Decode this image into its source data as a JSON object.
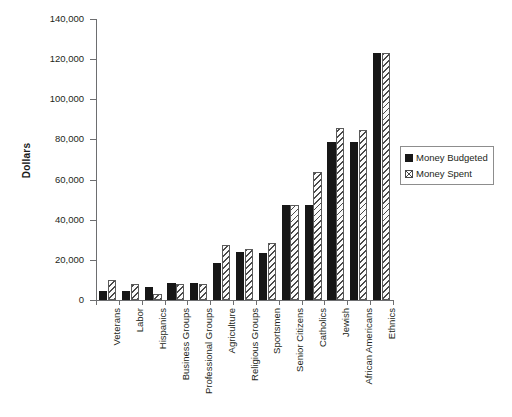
{
  "chart_data": {
    "type": "bar",
    "title": "",
    "xlabel": "",
    "ylabel": "Dollars",
    "ylim": [
      0,
      140000
    ],
    "ytick_step": 20000,
    "ytick_labels": [
      "0",
      "20,000",
      "40,000",
      "60,000",
      "80,000",
      "100,000",
      "120,000",
      "140,000"
    ],
    "ytick_values": [
      0,
      20000,
      40000,
      60000,
      80000,
      100000,
      120000,
      140000
    ],
    "grid": false,
    "legend_position": "right",
    "categories": [
      "Veterans",
      "Labor",
      "Hispanics",
      "Business Groups",
      "Professional Groups",
      "Agriculture",
      "Religious Groups",
      "Sportsmen",
      "Senior Citizens",
      "Catholics",
      "Jewish",
      "African Americans",
      "Ethnics"
    ],
    "series": [
      {
        "name": "Money Budgeted",
        "style": "solid-black",
        "values": [
          4500,
          4400,
          6500,
          8500,
          8300,
          18500,
          24000,
          23500,
          47500,
          47500,
          78500,
          78500,
          123000
        ]
      },
      {
        "name": "Money Spent",
        "style": "hatched",
        "values": [
          9800,
          8200,
          3000,
          8200,
          8200,
          27500,
          25500,
          28500,
          47500,
          64000,
          85500,
          84500,
          123000
        ]
      }
    ]
  },
  "legend": {
    "items": [
      {
        "label": "Money Budgeted",
        "swatch": "solid-square-icon"
      },
      {
        "label": "Money Spent",
        "swatch": "hatched-square-icon"
      }
    ]
  },
  "axis": {
    "y_title": "Dollars"
  }
}
